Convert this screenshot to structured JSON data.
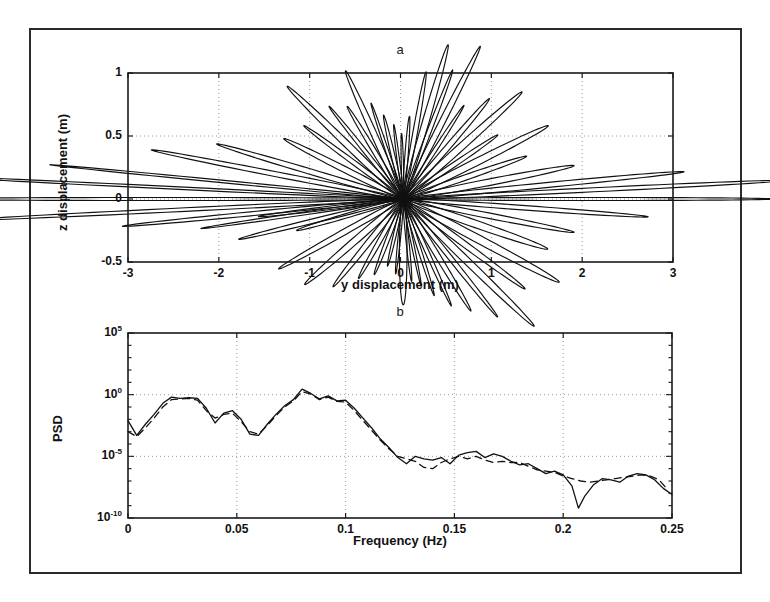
{
  "figure": {
    "background": "#ffffff",
    "border_color": "#2b2b2b",
    "panels": [
      "a",
      "b"
    ]
  },
  "panel_a": {
    "title": "a",
    "xlabel": "y displacement (m)",
    "ylabel": "z displacement (m)"
  },
  "panel_b": {
    "title": "b",
    "xlabel": "Frequency (Hz)",
    "ylabel": "PSD"
  },
  "chart_data": [
    {
      "type": "line",
      "panel": "a",
      "title": "a",
      "xlabel": "y displacement (m)",
      "ylabel": "z displacement (m)",
      "xlim": [
        -3,
        3
      ],
      "ylim": [
        -0.5,
        1
      ],
      "xticks": [
        -3,
        -2,
        -1,
        0,
        1,
        2,
        3
      ],
      "xtick_labels": [
        "-3",
        "-2",
        "-1",
        "0",
        "1",
        "2",
        "3"
      ],
      "yticks": [
        -0.5,
        0,
        0.5,
        1
      ],
      "ytick_labels": [
        "-0.5",
        "0",
        "0.5",
        "1"
      ],
      "grid": true,
      "grid_style": "dotted",
      "legend": "none",
      "description": "Particle orbit trajectories: narrow elongated ellipses radiating from a common origin near (0.03, 0.0), drawn as a star/rosette of thin loops of varying length and orientation.",
      "origin": [
        0.03,
        0.0
      ],
      "series": [
        {
          "name": "orbit-ellipses",
          "style": "solid",
          "color": "#111111",
          "ellipses": [
            {
              "angle_deg": 180,
              "semi_major": 2.62,
              "semi_minor": 0.012
            },
            {
              "angle_deg": 178,
              "semi_major": 2.58,
              "semi_minor": 0.01
            },
            {
              "angle_deg": 182,
              "semi_major": 2.4,
              "semi_minor": 0.014
            },
            {
              "angle_deg": 176,
              "semi_major": 1.95,
              "semi_minor": 0.01
            },
            {
              "angle_deg": 184,
              "semi_major": 1.55,
              "semi_minor": 0.016
            },
            {
              "angle_deg": 172,
              "semi_major": 1.4,
              "semi_minor": 0.02
            },
            {
              "angle_deg": 186,
              "semi_major": 1.12,
              "semi_minor": 0.012
            },
            {
              "angle_deg": 168,
              "semi_major": 1.05,
              "semi_minor": 0.022
            },
            {
              "angle_deg": 190,
              "semi_major": 0.92,
              "semi_minor": 0.018
            },
            {
              "angle_deg": 160,
              "semi_major": 0.7,
              "semi_minor": 0.025
            },
            {
              "angle_deg": 152,
              "semi_major": 0.62,
              "semi_minor": 0.02
            },
            {
              "angle_deg": 145,
              "semi_major": 0.78,
              "semi_minor": 0.03
            },
            {
              "angle_deg": 138,
              "semi_major": 0.55,
              "semi_minor": 0.018
            },
            {
              "angle_deg": 130,
              "semi_major": 0.48,
              "semi_minor": 0.022
            },
            {
              "angle_deg": 122,
              "semi_major": 0.6,
              "semi_minor": 0.03
            },
            {
              "angle_deg": 115,
              "semi_major": 0.42,
              "semi_minor": 0.016
            },
            {
              "angle_deg": 108,
              "semi_major": 0.35,
              "semi_minor": 0.02
            },
            {
              "angle_deg": 100,
              "semi_major": 0.3,
              "semi_minor": 0.014
            },
            {
              "angle_deg": 92,
              "semi_major": 0.26,
              "semi_minor": 0.012
            },
            {
              "angle_deg": 84,
              "semi_major": 0.33,
              "semi_minor": 0.018
            },
            {
              "angle_deg": 76,
              "semi_major": 0.52,
              "semi_minor": 0.025
            },
            {
              "angle_deg": 68,
              "semi_major": 0.66,
              "semi_minor": 0.035
            },
            {
              "angle_deg": 62,
              "semi_major": 0.58,
              "semi_minor": 0.022
            },
            {
              "angle_deg": 55,
              "semi_major": 0.74,
              "semi_minor": 0.03
            },
            {
              "angle_deg": 48,
              "semi_major": 0.5,
              "semi_minor": 0.018
            },
            {
              "angle_deg": 40,
              "semi_major": 0.62,
              "semi_minor": 0.026
            },
            {
              "angle_deg": 33,
              "semi_major": 0.78,
              "semi_minor": 0.032
            },
            {
              "angle_deg": 26,
              "semi_major": 0.58,
              "semi_minor": 0.02
            },
            {
              "angle_deg": 20,
              "semi_major": 0.85,
              "semi_minor": 0.03
            },
            {
              "angle_deg": 14,
              "semi_major": 0.7,
              "semi_minor": 0.022
            },
            {
              "angle_deg": 8,
              "semi_major": 0.95,
              "semi_minor": 0.026
            },
            {
              "angle_deg": 4,
              "semi_major": 1.55,
              "semi_minor": 0.02
            },
            {
              "angle_deg": 2,
              "semi_major": 2.1,
              "semi_minor": 0.016
            },
            {
              "angle_deg": 0,
              "semi_major": 2.05,
              "semi_minor": 0.012
            },
            {
              "angle_deg": -3,
              "semi_major": 1.35,
              "semi_minor": 0.018
            },
            {
              "angle_deg": -8,
              "semi_major": 0.95,
              "semi_minor": 0.022
            },
            {
              "angle_deg": -14,
              "semi_major": 0.82,
              "semi_minor": 0.03
            },
            {
              "angle_deg": -21,
              "semi_major": 0.92,
              "semi_minor": 0.034
            },
            {
              "angle_deg": -28,
              "semi_major": 0.76,
              "semi_minor": 0.026
            },
            {
              "angle_deg": -35,
              "semi_major": 0.88,
              "semi_minor": 0.032
            },
            {
              "angle_deg": -42,
              "semi_major": 0.7,
              "semi_minor": 0.022
            },
            {
              "angle_deg": -50,
              "semi_major": 0.58,
              "semi_minor": 0.026
            },
            {
              "angle_deg": -58,
              "semi_major": 0.5,
              "semi_minor": 0.02
            },
            {
              "angle_deg": -66,
              "semi_major": 0.42,
              "semi_minor": 0.018
            },
            {
              "angle_deg": -74,
              "semi_major": 0.36,
              "semi_minor": 0.014
            },
            {
              "angle_deg": -82,
              "semi_major": 0.33,
              "semi_minor": 0.016
            },
            {
              "angle_deg": -90,
              "semi_major": 0.42,
              "semi_minor": 0.042
            },
            {
              "angle_deg": -98,
              "semi_major": 0.3,
              "semi_minor": 0.014
            },
            {
              "angle_deg": -108,
              "semi_major": 0.28,
              "semi_minor": 0.016
            },
            {
              "angle_deg": -118,
              "semi_major": 0.34,
              "semi_minor": 0.02
            },
            {
              "angle_deg": -128,
              "semi_major": 0.4,
              "semi_minor": 0.022
            },
            {
              "angle_deg": -138,
              "semi_major": 0.52,
              "semi_minor": 0.026
            },
            {
              "angle_deg": -148,
              "semi_major": 0.64,
              "semi_minor": 0.03
            },
            {
              "angle_deg": -158,
              "semi_major": 0.74,
              "semi_minor": 0.024
            },
            {
              "angle_deg": -168,
              "semi_major": 0.6,
              "semi_minor": 0.018
            },
            {
              "angle_deg": -175,
              "semi_major": 0.8,
              "semi_minor": 0.014
            }
          ]
        }
      ]
    },
    {
      "type": "line",
      "panel": "b",
      "title": "b",
      "xlabel": "Frequency (Hz)",
      "ylabel": "PSD",
      "xlim": [
        0,
        0.25
      ],
      "ylim_log10": [
        -10,
        5
      ],
      "yscale": "log",
      "xticks": [
        0,
        0.05,
        0.1,
        0.15,
        0.2,
        0.25
      ],
      "xtick_labels": [
        "0",
        "0.05",
        "0.1",
        "0.15",
        "0.2",
        "0.25"
      ],
      "yticks_log10": [
        5,
        0,
        -5,
        -10
      ],
      "ytick_labels": [
        "10",
        "10",
        "10",
        "10"
      ],
      "ytick_exponents": [
        "5",
        "0",
        "-5",
        "-10"
      ],
      "grid": true,
      "grid_style": "dotted",
      "minor_ticks": true,
      "legend": "none",
      "series": [
        {
          "name": "measured-psd",
          "style": "solid",
          "color": "#111111",
          "x": [
            0.0,
            0.004,
            0.008,
            0.012,
            0.016,
            0.02,
            0.024,
            0.028,
            0.032,
            0.036,
            0.04,
            0.044,
            0.048,
            0.052,
            0.056,
            0.06,
            0.064,
            0.068,
            0.072,
            0.076,
            0.08,
            0.084,
            0.088,
            0.092,
            0.096,
            0.1,
            0.104,
            0.108,
            0.112,
            0.116,
            0.12,
            0.124,
            0.128,
            0.132,
            0.136,
            0.14,
            0.144,
            0.148,
            0.152,
            0.156,
            0.16,
            0.164,
            0.168,
            0.172,
            0.176,
            0.18,
            0.184,
            0.188,
            0.192,
            0.196,
            0.2,
            0.204,
            0.207,
            0.21,
            0.214,
            0.218,
            0.222,
            0.226,
            0.23,
            0.234,
            0.238,
            0.242,
            0.246,
            0.25
          ],
          "y_log10": [
            -2.1,
            -3.3,
            -2.4,
            -1.6,
            -0.7,
            -0.2,
            -0.3,
            -0.25,
            -0.3,
            -1.1,
            -2.3,
            -1.5,
            -1.3,
            -2.0,
            -3.2,
            -3.3,
            -2.4,
            -1.6,
            -0.9,
            -0.4,
            0.45,
            0.1,
            -0.35,
            -0.1,
            -0.5,
            -0.45,
            -1.1,
            -1.9,
            -2.7,
            -3.6,
            -4.3,
            -5.1,
            -5.6,
            -5.0,
            -5.2,
            -5.3,
            -5.1,
            -5.6,
            -4.9,
            -4.7,
            -4.6,
            -5.1,
            -4.8,
            -5.0,
            -5.4,
            -5.7,
            -5.6,
            -6.0,
            -6.4,
            -6.2,
            -6.5,
            -7.4,
            -9.2,
            -8.2,
            -7.3,
            -6.8,
            -6.9,
            -7.1,
            -6.6,
            -6.4,
            -6.5,
            -6.9,
            -7.6,
            -8.1
          ]
        },
        {
          "name": "modelled-psd",
          "style": "dashed",
          "color": "#111111",
          "x": [
            0.0,
            0.004,
            0.008,
            0.012,
            0.016,
            0.02,
            0.024,
            0.028,
            0.032,
            0.036,
            0.04,
            0.044,
            0.048,
            0.052,
            0.056,
            0.06,
            0.064,
            0.068,
            0.072,
            0.076,
            0.08,
            0.084,
            0.088,
            0.092,
            0.096,
            0.1,
            0.104,
            0.108,
            0.112,
            0.116,
            0.12,
            0.124,
            0.128,
            0.132,
            0.136,
            0.14,
            0.144,
            0.148,
            0.152,
            0.156,
            0.16,
            0.164,
            0.168,
            0.172,
            0.176,
            0.18,
            0.184,
            0.188,
            0.192,
            0.196,
            0.2,
            0.204,
            0.208,
            0.212,
            0.216,
            0.22,
            0.224,
            0.228,
            0.232,
            0.236,
            0.24,
            0.244,
            0.248
          ],
          "y_log10": [
            -3.0,
            -3.4,
            -2.7,
            -1.9,
            -1.0,
            -0.4,
            -0.35,
            -0.3,
            -0.45,
            -1.3,
            -1.9,
            -1.6,
            -1.5,
            -2.2,
            -3.0,
            -3.2,
            -2.5,
            -1.7,
            -1.0,
            -0.5,
            0.25,
            0.05,
            -0.4,
            -0.2,
            -0.55,
            -0.6,
            -1.3,
            -2.1,
            -2.9,
            -3.7,
            -4.4,
            -5.0,
            -5.2,
            -5.4,
            -5.9,
            -6.0,
            -5.5,
            -5.2,
            -5.0,
            -5.2,
            -5.0,
            -5.3,
            -5.5,
            -5.4,
            -5.5,
            -5.5,
            -5.8,
            -6.1,
            -6.2,
            -6.3,
            -6.6,
            -6.8,
            -7.0,
            -7.1,
            -7.0,
            -6.9,
            -6.8,
            -6.7,
            -6.6,
            -6.5,
            -6.6,
            -6.9,
            -7.7
          ]
        }
      ]
    }
  ]
}
